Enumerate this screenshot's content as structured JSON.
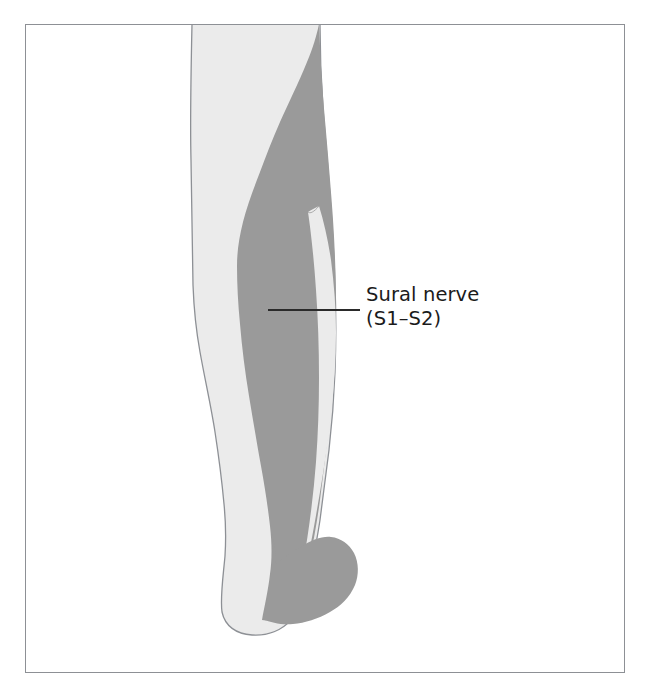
{
  "figure": {
    "background_color": "#ffffff",
    "frame": {
      "border_color": "#8d9095",
      "fill_color": "#ffffff",
      "x": 25,
      "y": 24,
      "width": 600,
      "height": 649
    }
  },
  "labels": [
    {
      "name": "sural-nerve-label",
      "line_1": "Sural nerve",
      "line_2": "(S1–S2)",
      "text_color": "#1b1b1b",
      "leader_line": {
        "x1": 268,
        "y1": 310,
        "x2": 360,
        "y2": 310,
        "color": "#2a2a2a"
      }
    }
  ],
  "regions": [
    {
      "name": "leg-silhouette",
      "description": "Posterior view of right lower leg and foot, light gray skin area",
      "fill_color": "#ebebeb",
      "outline_color": "#8d9095"
    },
    {
      "name": "sural-nerve-territory",
      "description": "Dark gray shaded band of sural nerve cutaneous distribution down the posterolateral calf to the lateral foot border",
      "fill_color": "#9a9a9a",
      "outline_color": "#9a9a9a"
    }
  ],
  "legend": {
    "shading_key": [
      {
        "swatch_color": "#9a9a9a",
        "meaning": "Sural nerve (S1–S2) cutaneous distribution"
      },
      {
        "swatch_color": "#ebebeb",
        "meaning": "Leg and foot skin (unshaded)"
      }
    ]
  }
}
